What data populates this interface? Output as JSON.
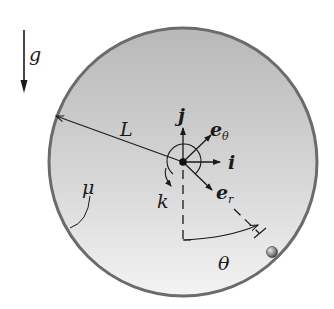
{
  "figure": {
    "gravity": {
      "label": "g"
    },
    "radius": {
      "label": "L"
    },
    "friction": {
      "label": "μ"
    },
    "angular_axis": {
      "label": "k"
    },
    "unit_vectors": {
      "j": "j",
      "i": "i",
      "e_theta": {
        "base": "e",
        "sub": "θ"
      },
      "e_r": {
        "base": "e",
        "sub": "r"
      }
    },
    "angle": {
      "label": "θ"
    },
    "colors": {
      "disk_fill_top": "#bdbdbd",
      "disk_fill_bottom": "#f2f2f2",
      "rim": "#6b6b6b",
      "ink": "#1a1a1a",
      "ball": "#8a8a8a"
    }
  }
}
